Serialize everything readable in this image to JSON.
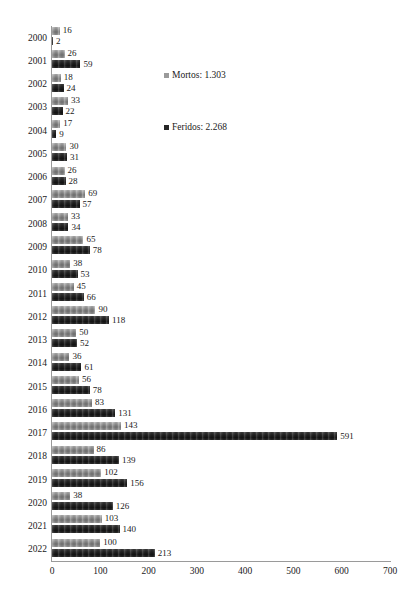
{
  "chart_data": {
    "type": "bar",
    "orientation": "horizontal",
    "title": "",
    "subtitle": "",
    "xlabel": "",
    "ylabel": "",
    "xlim": [
      0,
      700
    ],
    "xticks": [
      0,
      100,
      200,
      300,
      400,
      500,
      600,
      700
    ],
    "grid": false,
    "legend_position": "inside-upper-right",
    "categories": [
      "2000",
      "2001",
      "2002",
      "2003",
      "2004",
      "2005",
      "2006",
      "2007",
      "2008",
      "2009",
      "2010",
      "2011",
      "2012",
      "2013",
      "2014",
      "2015",
      "2016",
      "2017",
      "2018",
      "2019",
      "2020",
      "2021",
      "2022"
    ],
    "series": [
      {
        "name": "Mortos",
        "legend_label": "Mortos: 1.303",
        "total": 1303,
        "color": "#8a8a8a",
        "values": [
          16,
          26,
          18,
          33,
          17,
          30,
          26,
          69,
          33,
          65,
          38,
          45,
          90,
          50,
          36,
          56,
          83,
          143,
          86,
          102,
          38,
          103,
          100
        ]
      },
      {
        "name": "Feridos",
        "legend_label": "Feridos: 2.268",
        "total": 2268,
        "color": "#2c2c2c",
        "values": [
          2,
          59,
          24,
          22,
          9,
          31,
          28,
          57,
          34,
          78,
          53,
          66,
          118,
          52,
          61,
          78,
          131,
          591,
          139,
          156,
          126,
          140,
          213
        ]
      }
    ]
  }
}
